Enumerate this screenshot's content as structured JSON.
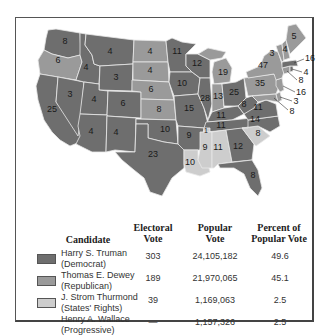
{
  "colors": {
    "truman": "#6e6e6e",
    "dewey": "#9a9a9a",
    "thurmond": "#cdcdcd",
    "border": "#555555"
  },
  "map": {
    "title": "1948 Presidential Election",
    "states": [
      {
        "id": "WA",
        "votes": "8",
        "winner": "truman"
      },
      {
        "id": "OR",
        "votes": "6",
        "winner": "dewey"
      },
      {
        "id": "CA",
        "votes": "25",
        "winner": "truman"
      },
      {
        "id": "ID",
        "votes": "4",
        "winner": "truman"
      },
      {
        "id": "NV",
        "votes": "3",
        "winner": "truman"
      },
      {
        "id": "MT",
        "votes": "4",
        "winner": "truman"
      },
      {
        "id": "WY",
        "votes": "3",
        "winner": "truman"
      },
      {
        "id": "UT",
        "votes": "4",
        "winner": "truman"
      },
      {
        "id": "AZ",
        "votes": "4",
        "winner": "truman"
      },
      {
        "id": "CO",
        "votes": "6",
        "winner": "truman"
      },
      {
        "id": "NM",
        "votes": "4",
        "winner": "truman"
      },
      {
        "id": "ND",
        "votes": "4",
        "winner": "dewey"
      },
      {
        "id": "SD",
        "votes": "4",
        "winner": "dewey"
      },
      {
        "id": "NE",
        "votes": "6",
        "winner": "dewey"
      },
      {
        "id": "KS",
        "votes": "8",
        "winner": "dewey"
      },
      {
        "id": "OK",
        "votes": "10",
        "winner": "truman"
      },
      {
        "id": "TX",
        "votes": "23",
        "winner": "truman"
      },
      {
        "id": "MN",
        "votes": "11",
        "winner": "truman"
      },
      {
        "id": "IA",
        "votes": "10",
        "winner": "truman"
      },
      {
        "id": "MO",
        "votes": "15",
        "winner": "truman"
      },
      {
        "id": "AR",
        "votes": "9",
        "winner": "truman"
      },
      {
        "id": "LA",
        "votes": "10",
        "winner": "thurmond"
      },
      {
        "id": "WI",
        "votes": "12",
        "winner": "truman"
      },
      {
        "id": "IL",
        "votes": "28",
        "winner": "truman"
      },
      {
        "id": "MI",
        "votes": "19",
        "winner": "dewey"
      },
      {
        "id": "IN",
        "votes": "13",
        "winner": "dewey"
      },
      {
        "id": "OH",
        "votes": "25",
        "winner": "truman"
      },
      {
        "id": "KY",
        "votes": "11",
        "winner": "truman"
      },
      {
        "id": "TN",
        "votes": "11",
        "winner": "truman"
      },
      {
        "id": "TN-split",
        "votes": "1",
        "winner": "thurmond"
      },
      {
        "id": "MS",
        "votes": "9",
        "winner": "thurmond"
      },
      {
        "id": "AL",
        "votes": "11",
        "winner": "thurmond"
      },
      {
        "id": "GA",
        "votes": "12",
        "winner": "truman"
      },
      {
        "id": "FL",
        "votes": "8",
        "winner": "truman"
      },
      {
        "id": "SC",
        "votes": "8",
        "winner": "thurmond"
      },
      {
        "id": "NC",
        "votes": "14",
        "winner": "truman"
      },
      {
        "id": "VA",
        "votes": "11",
        "winner": "truman"
      },
      {
        "id": "WV",
        "votes": "8",
        "winner": "truman"
      },
      {
        "id": "PA",
        "votes": "35",
        "winner": "dewey"
      },
      {
        "id": "NY",
        "votes": "47",
        "winner": "dewey"
      },
      {
        "id": "VT",
        "votes": "3",
        "winner": "dewey"
      },
      {
        "id": "NH",
        "votes": "4",
        "winner": "dewey"
      },
      {
        "id": "ME",
        "votes": "5",
        "winner": "dewey"
      },
      {
        "id": "MA",
        "votes": "16",
        "winner": "truman"
      },
      {
        "id": "RI",
        "votes": "4",
        "winner": "truman"
      },
      {
        "id": "CT",
        "votes": "8",
        "winner": "dewey"
      },
      {
        "id": "NJ",
        "votes": "16",
        "winner": "dewey"
      },
      {
        "id": "DE",
        "votes": "3",
        "winner": "dewey"
      },
      {
        "id": "MD",
        "votes": "8",
        "winner": "dewey"
      }
    ]
  },
  "table": {
    "headers": {
      "candidate": "Candidate",
      "electoral_1": "Electoral",
      "electoral_2": "Vote",
      "popular_1": "Popular",
      "popular_2": "Vote",
      "percent_1": "Percent of",
      "percent_2": "Popular Vote"
    },
    "rows": [
      {
        "name": "Harry S. Truman",
        "party": "(Democrat)",
        "electoral": "303",
        "popular": "24,105,182",
        "percent": "49.6",
        "swatch": "truman"
      },
      {
        "name": "Thomas E. Dewey",
        "party": "(Republican)",
        "electoral": "189",
        "popular": "21,970,065",
        "percent": "45.1",
        "swatch": "dewey"
      },
      {
        "name": "J. Strom Thurmond",
        "party": "(States' Rights)",
        "electoral": "39",
        "popular": "1,169,063",
        "percent": "2.5",
        "swatch": "thurmond"
      },
      {
        "name": "Henry A. Wallace",
        "party": "(Progressive)",
        "electoral": "—",
        "popular": "1,157,326",
        "percent": "2.5",
        "swatch": null
      }
    ]
  }
}
